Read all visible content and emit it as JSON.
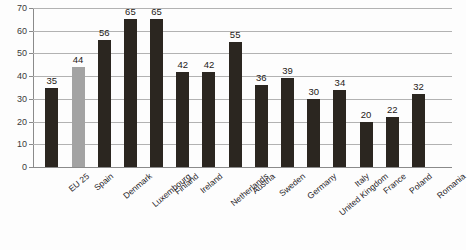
{
  "chart_data": {
    "type": "bar",
    "title": "",
    "subtitle": "",
    "xlabel": "",
    "ylabel": "",
    "ylim": [
      0,
      70
    ],
    "ytick_values": [
      0,
      10,
      20,
      30,
      40,
      50,
      60,
      70
    ],
    "ytick_labels": [
      "0",
      "10",
      "20",
      "30",
      "40",
      "50",
      "60",
      "70"
    ],
    "grid": true,
    "legend": "none",
    "categories": [
      "EU 25",
      "Spain",
      "Denmark",
      "Luxembourg",
      "Finland",
      "Ireland",
      "Netherlands",
      "Austria",
      "Sweden",
      "Germany",
      "United Kingdom",
      "Italy",
      "France",
      "Poland",
      "Romania"
    ],
    "values": [
      35,
      44,
      56,
      65,
      65,
      42,
      42,
      55,
      36,
      39,
      30,
      34,
      20,
      22,
      32
    ],
    "value_labels": [
      "35",
      "44",
      "56",
      "65",
      "65",
      "42",
      "42",
      "55",
      "36",
      "39",
      "30",
      "34",
      "20",
      "22",
      "32"
    ],
    "highlight_category": "Spain",
    "colors": {
      "bar": "#2b2620",
      "bar_highlight": "#a3a3a3",
      "gridline": "#b2b2b2",
      "axis": "#8a8a8a",
      "text": "#24211e",
      "background": "#fdfdfd"
    }
  }
}
